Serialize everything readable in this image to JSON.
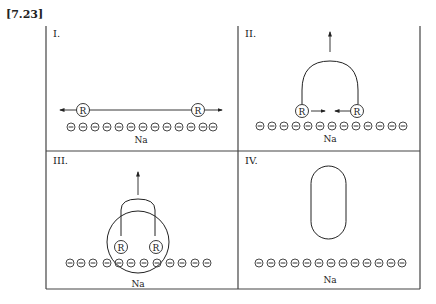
{
  "figure": {
    "reference": "[7.23]",
    "panels": [
      {
        "label": "I.",
        "bottom_label": "Na",
        "description": "Two R atoms far apart on Na surface, moving apart"
      },
      {
        "label": "II.",
        "bottom_label": "Na",
        "description": "Two R atoms approaching, bonded arc lifting up"
      },
      {
        "label": "III.",
        "bottom_label": "Na",
        "description": "R atoms bonded inside circle, lifting off surface"
      },
      {
        "label": "IV.",
        "bottom_label": "Na",
        "description": "Molecule desorbed from surface"
      }
    ],
    "atom_label": "R",
    "charge_symbol": "−",
    "charges_per_row": 13
  }
}
